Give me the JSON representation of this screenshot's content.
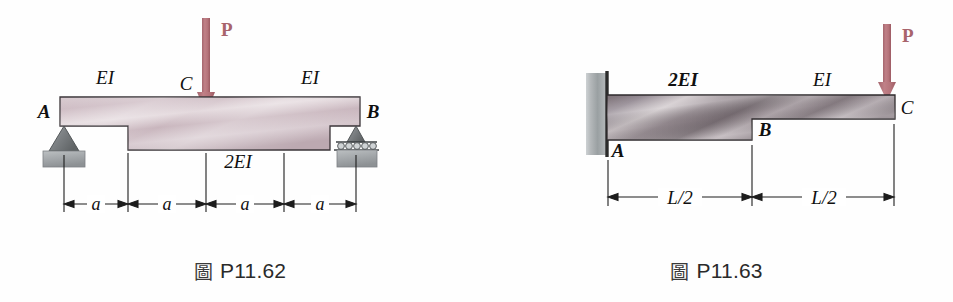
{
  "page": {
    "background": "#ffffff",
    "width": 953,
    "height": 302,
    "content_type": "textbook-engineering-beam-diagrams"
  },
  "palette": {
    "load_arrow": "#b5737a",
    "load_arrow_dark": "#9c5a62",
    "beam_outline": "#3a3438",
    "beam_fill_left_light": "#e4d9dd",
    "beam_fill_left_mid": "#c9b5bd",
    "beam_fill_left_dark": "#b09aa3",
    "beam_fill_right_light": "#d8d2d4",
    "beam_fill_right_mid": "#8e8389",
    "beam_fill_right_dark": "#6d6268",
    "support_grey": "#8e9294",
    "support_grey_dark": "#6e7274",
    "ground_block": "#a9adb0",
    "dimension_line": "#1c1c1c",
    "label_text": "#101010",
    "caption_text": "#2a2a2a"
  },
  "figures": [
    {
      "id": "P11.62",
      "caption_glyph": "圖",
      "caption_text": "P11.62",
      "description": "Simply supported stepped beam with central point load",
      "load": {
        "label": "P",
        "direction": "down",
        "applied_at": "C",
        "color": "#b5737a"
      },
      "nodes": [
        {
          "label": "A",
          "type": "pin-support",
          "position": "left-end"
        },
        {
          "label": "C",
          "type": "load-point",
          "position": "midspan"
        },
        {
          "label": "B",
          "type": "roller-support",
          "position": "right-end"
        }
      ],
      "stiffness_labels": [
        {
          "text": "EI",
          "segment": "left-outer",
          "placement": "above-beam"
        },
        {
          "text": "EI",
          "segment": "right-outer",
          "placement": "above-beam"
        },
        {
          "text": "2EI",
          "segment": "middle",
          "placement": "below-beam"
        }
      ],
      "dimensions": [
        {
          "label": "a",
          "span": "A to first step"
        },
        {
          "label": "a",
          "span": "first step to C"
        },
        {
          "label": "a",
          "span": "C to second step"
        },
        {
          "label": "a",
          "span": "second step to B"
        }
      ],
      "total_length": "4a"
    },
    {
      "id": "P11.63",
      "caption_glyph": "圖",
      "caption_text": "P11.63",
      "description": "Cantilever stepped beam fixed at A with tip load at C",
      "load": {
        "label": "P",
        "direction": "down",
        "applied_at": "C",
        "color": "#b5737a"
      },
      "nodes": [
        {
          "label": "A",
          "type": "fixed-support",
          "position": "left-end"
        },
        {
          "label": "B",
          "type": "step-point",
          "position": "midspan"
        },
        {
          "label": "C",
          "type": "free-end",
          "position": "right-end"
        }
      ],
      "stiffness_labels": [
        {
          "text": "2EI",
          "segment": "left-half",
          "placement": "above-beam"
        },
        {
          "text": "EI",
          "segment": "right-half",
          "placement": "above-beam"
        }
      ],
      "dimensions": [
        {
          "label": "L/2",
          "span": "A to B"
        },
        {
          "label": "L/2",
          "span": "B to C"
        }
      ],
      "total_length": "L"
    }
  ]
}
